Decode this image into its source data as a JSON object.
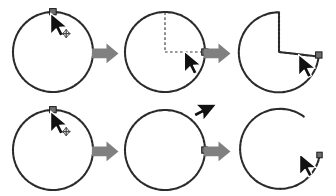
{
  "figure": {
    "background_color": "#ffffff",
    "rows": 2,
    "columns": 3,
    "width": 336,
    "height": 196
  },
  "colors": {
    "shape_stroke": "#2b2b2b",
    "guide_dash": "#3a3a3a",
    "cursor_fill": "#111111",
    "cursor_outline": "#ffffff",
    "handle_fill": "#6e6e6e",
    "handle_stroke": "#1a1a1a",
    "arrow_fill": "#808080",
    "background": "#ffffff"
  },
  "rows": [
    {
      "id": "pie-sequence",
      "name": "Pie wedge drag sequence",
      "steps": [
        {
          "id": "pie-step-1",
          "label": "Grab the top handle of the circle",
          "shape": "circle",
          "cursor": "move-cursor",
          "cursor_glyph": "+",
          "handle_position": "top",
          "guides": "none"
        },
        {
          "id": "pie-step-2",
          "label": "Drag inward to the center then out to the right edge",
          "shape": "circle",
          "cursor": "arrow-cursor",
          "cursor_glyph": "",
          "handle_position": "right",
          "guides": "radius-vertical-and-horizontal"
        },
        {
          "id": "pie-step-3",
          "label": "Result is a pie wedge cut from the circle",
          "shape": "pie-wedge",
          "cursor": "arrow-cursor",
          "cursor_glyph": "",
          "handle_position": "right",
          "guides": "none"
        }
      ]
    },
    {
      "id": "arc-sequence",
      "name": "Open arc drag sequence",
      "steps": [
        {
          "id": "arc-step-1",
          "label": "Grab the top handle of the circle",
          "shape": "circle",
          "cursor": "move-cursor",
          "cursor_glyph": "+",
          "handle_position": "top",
          "guides": "none"
        },
        {
          "id": "arc-step-2",
          "label": "Drag outside the circle to the upper right",
          "shape": "circle",
          "cursor": "arrow-cursor-left",
          "cursor_glyph": "",
          "handle_position": "right",
          "guides": "none"
        },
        {
          "id": "arc-step-3",
          "label": "Result is an open arc with a gap",
          "shape": "open-arc",
          "cursor": "arrow-cursor",
          "cursor_glyph": "",
          "handle_position": "arc-end",
          "guides": "none"
        }
      ]
    }
  ],
  "connectors": [
    {
      "id": "connector-1",
      "name": "step-1-to-2-arrow",
      "direction": "right"
    },
    {
      "id": "connector-2",
      "name": "step-2-to-3-arrow",
      "direction": "right"
    },
    {
      "id": "connector-3",
      "name": "step-1-to-2-arrow",
      "direction": "right"
    },
    {
      "id": "connector-4",
      "name": "step-2-to-3-arrow",
      "direction": "right"
    }
  ]
}
